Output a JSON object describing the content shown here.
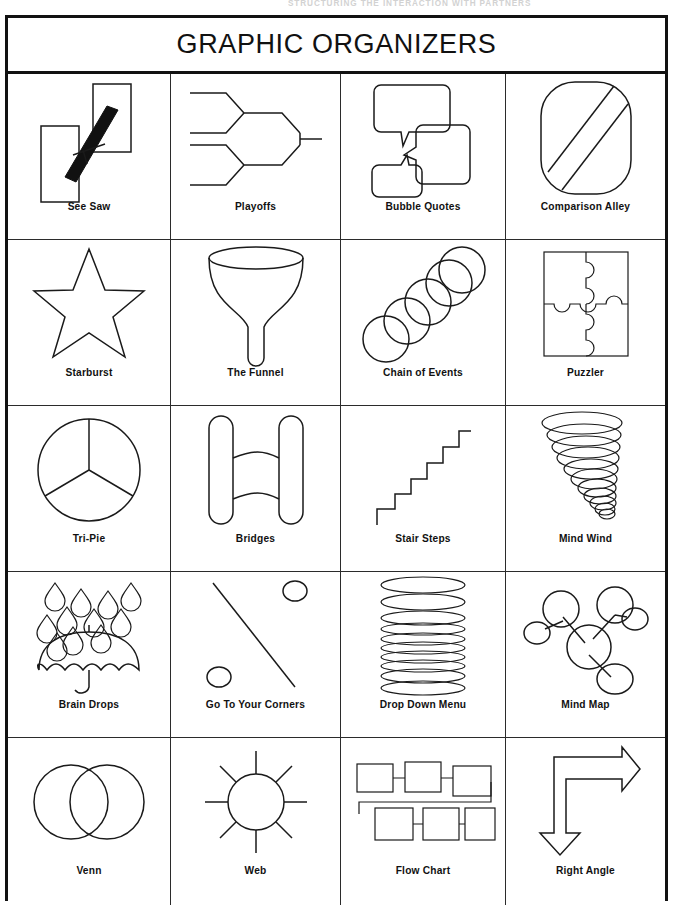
{
  "page": {
    "running_head": "Structuring the Interaction with Partners",
    "title": "GRAPHIC ORGANIZERS",
    "ink_color": "#1a1a1a",
    "background_color": "#ffffff",
    "columns": 4,
    "rows": 5
  },
  "organizers": [
    [
      {
        "label": "See Saw",
        "icon": "see-saw-icon"
      },
      {
        "label": "Playoffs",
        "icon": "playoffs-bracket-icon"
      },
      {
        "label": "Bubble Quotes",
        "icon": "bubble-quotes-icon"
      },
      {
        "label": "Comparison Alley",
        "icon": "comparison-alley-icon"
      }
    ],
    [
      {
        "label": "Starburst",
        "icon": "starburst-star-icon"
      },
      {
        "label": "The Funnel",
        "icon": "funnel-icon"
      },
      {
        "label": "Chain of Events",
        "icon": "chain-of-events-icon"
      },
      {
        "label": "Puzzler",
        "icon": "puzzle-pieces-icon"
      }
    ],
    [
      {
        "label": "Tri-Pie",
        "icon": "tri-pie-icon"
      },
      {
        "label": "Bridges",
        "icon": "bridges-icon"
      },
      {
        "label": "Stair Steps",
        "icon": "stair-steps-icon"
      },
      {
        "label": "Mind Wind",
        "icon": "mind-wind-tornado-icon"
      }
    ],
    [
      {
        "label": "Brain Drops",
        "icon": "umbrella-raindrops-icon"
      },
      {
        "label": "Go To Your Corners",
        "icon": "go-to-your-corners-icon"
      },
      {
        "label": "Drop Down Menu",
        "icon": "drop-down-menu-icon"
      },
      {
        "label": "Mind Map",
        "icon": "mind-map-icon"
      }
    ],
    [
      {
        "label": "Venn",
        "icon": "venn-diagram-icon"
      },
      {
        "label": "Web",
        "icon": "web-spokes-icon"
      },
      {
        "label": "Flow Chart",
        "icon": "flow-chart-icon"
      },
      {
        "label": "Right Angle",
        "icon": "right-angle-arrow-icon"
      }
    ]
  ]
}
